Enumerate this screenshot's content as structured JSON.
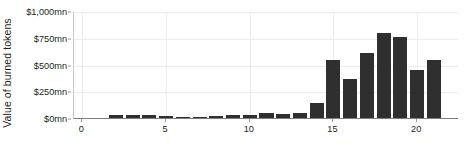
{
  "chart_data": {
    "type": "bar",
    "title": "",
    "subtitle": "",
    "xlabel": "",
    "ylabel": "Value of burned tokens",
    "categories": [
      2,
      3,
      4,
      5,
      6,
      7,
      8,
      9,
      10,
      11,
      12,
      13,
      14,
      15,
      16,
      17,
      18,
      19,
      20,
      21
    ],
    "values": [
      30,
      28,
      30,
      18,
      8,
      14,
      20,
      32,
      30,
      45,
      40,
      45,
      145,
      545,
      365,
      605,
      790,
      760,
      450,
      545
    ],
    "series": [
      {
        "name": "Value of burned tokens",
        "values": [
          30,
          28,
          30,
          18,
          8,
          14,
          20,
          32,
          30,
          45,
          40,
          45,
          145,
          545,
          365,
          605,
          790,
          760,
          450,
          545
        ]
      }
    ],
    "ylim": [
      0,
      1000
    ],
    "xlim": [
      -0.5,
      22.5
    ],
    "y_ticks": [
      0,
      250,
      500,
      750,
      1000
    ],
    "y_tick_labels": [
      "$0mn",
      "$250mn",
      "$500mn",
      "$750mn",
      "$1,000mn"
    ],
    "x_ticks": [
      0,
      5,
      10,
      15,
      20
    ],
    "x_tick_labels": [
      "0",
      "5",
      "10",
      "15",
      "20"
    ],
    "grid": {
      "horizontal": true,
      "vertical": true
    },
    "legend": {
      "visible": false,
      "position": "none"
    },
    "bar_color": "#2f2f2f",
    "grid_color": "#ececec",
    "axis_color": "#7d7d7d",
    "background_color": "#ffffff",
    "text_color": "#231f20",
    "units": "mn",
    "currency_symbol": "$"
  }
}
